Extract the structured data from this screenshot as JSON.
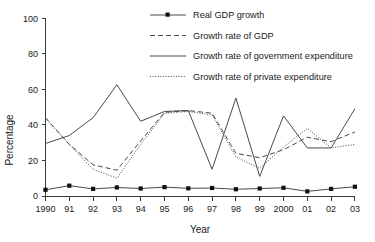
{
  "chart_data": {
    "type": "line",
    "title": "",
    "xlabel": "Year",
    "ylabel": "Percentage",
    "xlim": [
      0,
      13
    ],
    "ylim": [
      0,
      100
    ],
    "yticks": [
      0,
      20,
      40,
      60,
      80,
      100
    ],
    "grid": false,
    "legend_position": "top-right",
    "categories": [
      "1990",
      "91",
      "92",
      "93",
      "94",
      "95",
      "96",
      "97",
      "98",
      "99",
      "2000",
      "01",
      "02",
      "03"
    ],
    "series": [
      {
        "name": "Real GDP growth",
        "style": "solid-with-square-markers",
        "values": [
          3.5,
          5.8,
          4.0,
          4.8,
          4.2,
          5.0,
          4.3,
          4.5,
          3.8,
          4.2,
          4.6,
          2.6,
          4.0,
          5.2
        ]
      },
      {
        "name": "Growth rate of GDP",
        "style": "dashed",
        "values": [
          44.0,
          29.0,
          17.5,
          14.5,
          31.0,
          47.0,
          48.0,
          46.5,
          24.0,
          21.5,
          26.0,
          33.0,
          30.5,
          36.0
        ]
      },
      {
        "name": "Growth rate of government expenditure",
        "style": "solid",
        "values": [
          29.5,
          34.0,
          44.0,
          62.5,
          42.0,
          47.5,
          48.0,
          15.0,
          55.0,
          11.0,
          45.0,
          27.0,
          27.0,
          49.0
        ]
      },
      {
        "name": "Growth rate of private expenditure",
        "style": "dotted",
        "values": [
          43.5,
          29.0,
          15.0,
          10.0,
          29.0,
          46.5,
          47.5,
          45.5,
          22.0,
          15.5,
          27.5,
          38.0,
          27.0,
          29.0
        ]
      }
    ],
    "legend": [
      {
        "label": "Real GDP growth",
        "style": "solid-with-square-markers"
      },
      {
        "label": "Growth rate of GDP",
        "style": "dashed"
      },
      {
        "label": "Growth rate of government expenditure",
        "style": "solid"
      },
      {
        "label": "Growth rate of private expenditure",
        "style": "dotted"
      }
    ],
    "colors": {
      "axis": "#3a3a3a",
      "line": "#4a4a4a",
      "marker": "#111111",
      "text": "#1a1a1a",
      "background": "#ffffff"
    }
  }
}
